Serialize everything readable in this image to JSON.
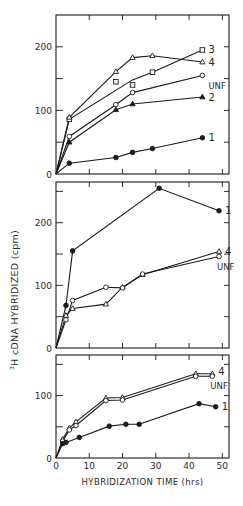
{
  "figure": {
    "ylabel": "cDNA HYBRIDIZED (cpm)",
    "ylabel_prefix_sup": "3",
    "ylabel_prefix": "H",
    "xlabel": "HYBRIDIZATION TIME (hrs)",
    "x_ticks": [
      "0",
      "10",
      "20",
      "30",
      "40",
      "50"
    ],
    "ink_color": "#1a1a1a"
  },
  "chart_data": [
    {
      "type": "line",
      "panel": "top",
      "xlabel": "HYBRIDIZATION TIME (hrs)",
      "ylabel": "3H cDNA HYBRIDIZED (cpm)",
      "xlim": [
        0,
        52
      ],
      "ylim": [
        0,
        250
      ],
      "y_ticks": [
        0,
        100,
        200
      ],
      "y_tick_labels": [
        "0",
        "100",
        "200"
      ],
      "grid": false,
      "series": [
        {
          "name": "3",
          "marker": "square-open",
          "x": [
            0,
            4,
            18,
            23,
            29,
            44
          ],
          "y": [
            0,
            86,
            145,
            140,
            160,
            195
          ]
        },
        {
          "name": "4",
          "marker": "triangle-open",
          "x": [
            0,
            4,
            18,
            23,
            29,
            44
          ],
          "y": [
            0,
            89,
            161,
            183,
            186,
            176
          ]
        },
        {
          "name": "UNF",
          "marker": "circle-open",
          "x": [
            0,
            4,
            18,
            23,
            44
          ],
          "y": [
            0,
            59,
            109,
            128,
            155
          ]
        },
        {
          "name": "2",
          "marker": "triangle-filled",
          "x": [
            0,
            4,
            18,
            23,
            44
          ],
          "y": [
            0,
            50,
            101,
            110,
            121
          ]
        },
        {
          "name": "1",
          "marker": "circle-filled",
          "x": [
            0,
            4,
            18,
            23,
            29,
            44
          ],
          "y": [
            0,
            17,
            26,
            34,
            40,
            57
          ]
        }
      ],
      "line_paths": {
        "3": [
          [
            0,
            0
          ],
          [
            4,
            86
          ],
          [
            23,
            148
          ],
          [
            29,
            160
          ],
          [
            44,
            195
          ]
        ]
      },
      "legend_position": "right-inline"
    },
    {
      "type": "line",
      "panel": "middle",
      "xlabel": "HYBRIDIZATION TIME (hrs)",
      "ylabel": "3H cDNA HYBRIDIZED (cpm)",
      "xlim": [
        0,
        52
      ],
      "ylim": [
        0,
        265
      ],
      "y_ticks": [
        0,
        100,
        200
      ],
      "y_tick_labels": [
        "0",
        "100",
        "200"
      ],
      "grid": false,
      "series": [
        {
          "name": "1",
          "marker": "circle-filled",
          "x": [
            0,
            3,
            5,
            31,
            49
          ],
          "y": [
            0,
            68,
            155,
            255,
            219
          ]
        },
        {
          "name": "4",
          "marker": "triangle-open",
          "x": [
            0,
            3,
            5,
            15,
            20,
            26,
            49
          ],
          "y": [
            0,
            52,
            63,
            70,
            97,
            117,
            154
          ]
        },
        {
          "name": "UNF",
          "marker": "circle-open",
          "x": [
            0,
            3,
            5,
            15,
            20,
            26,
            49
          ],
          "y": [
            0,
            45,
            76,
            97,
            96,
            118,
            146
          ]
        }
      ],
      "legend_position": "right-inline"
    },
    {
      "type": "line",
      "panel": "bottom",
      "xlabel": "HYBRIDIZATION TIME (hrs)",
      "ylabel": "3H cDNA HYBRIDIZED (cpm)",
      "xlim": [
        0,
        52
      ],
      "ylim": [
        0,
        165
      ],
      "x_ticks": [
        0,
        10,
        20,
        30,
        40,
        50
      ],
      "y_ticks": [
        0,
        100
      ],
      "y_tick_labels": [
        "0",
        "100"
      ],
      "grid": false,
      "series": [
        {
          "name": "4",
          "marker": "triangle-open",
          "x": [
            0,
            2,
            4,
            6,
            15,
            20,
            42,
            47
          ],
          "y": [
            0,
            30,
            48,
            58,
            96,
            97,
            135,
            135
          ]
        },
        {
          "name": "UNF",
          "marker": "circle-open",
          "x": [
            0,
            2,
            4,
            6,
            15,
            20,
            42,
            47
          ],
          "y": [
            0,
            27,
            45,
            52,
            92,
            93,
            131,
            131
          ]
        },
        {
          "name": "1",
          "marker": "circle-filled",
          "x": [
            0,
            2,
            3,
            7,
            16,
            21,
            25,
            43,
            48
          ],
          "y": [
            0,
            23,
            25,
            33,
            51,
            54,
            54,
            87,
            82
          ]
        }
      ],
      "legend_position": "right-inline"
    }
  ]
}
